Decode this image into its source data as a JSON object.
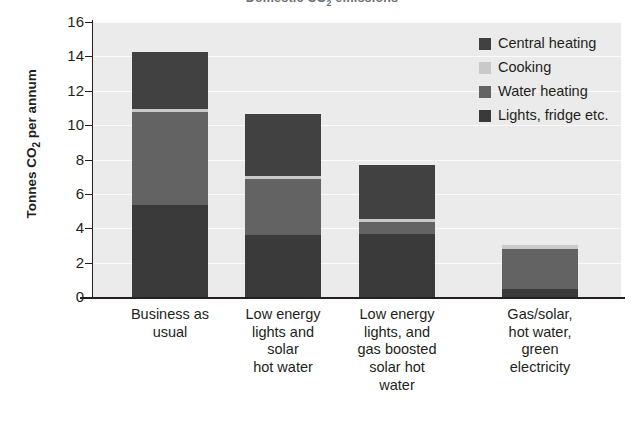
{
  "chart_data": {
    "type": "bar",
    "subtype": "stacked-bar",
    "title": "Domestic CO2 emissions",
    "title_html": "Domestic CO<sub>2</sub> emissions",
    "xlabel": "",
    "ylabel": "Tonnes CO2 per annum",
    "ylabel_html": "Tonnes CO<sub>2</sub> per annum",
    "ylim": [
      0,
      16
    ],
    "ytick_step": 2,
    "yticks": [
      0,
      2,
      4,
      6,
      8,
      10,
      12,
      14,
      16
    ],
    "grid": true,
    "grid_axis": "y",
    "legend_position": "top-right",
    "categories": [
      "Business as usual",
      "Low energy lights and solar hot water",
      "Low energy lights, and gas boosted solar hot water",
      "Gas/solar, hot water, green electricity"
    ],
    "category_lines": [
      [
        "Business as",
        "usual"
      ],
      [
        "Low energy",
        "lights and",
        "solar",
        "hot water"
      ],
      [
        "Low energy",
        "lights, and",
        "gas boosted",
        "solar hot",
        "water"
      ],
      [
        "Gas/solar,",
        "hot water,",
        "green",
        "electricity"
      ]
    ],
    "stack_order_bottom_to_top": [
      "Lights, fridge etc.",
      "Water heating",
      "Cooking",
      "Central heating"
    ],
    "series": [
      {
        "name": "Lights, fridge etc.",
        "color": "#3a3a3a",
        "values": [
          5.35,
          3.6,
          3.65,
          0.45
        ]
      },
      {
        "name": "Water heating",
        "color": "#636363",
        "values": [
          5.4,
          3.25,
          0.7,
          2.35
        ]
      },
      {
        "name": "Cooking",
        "color": "#c9c9c9",
        "values": [
          0.2,
          0.2,
          0.2,
          0.2
        ]
      },
      {
        "name": "Central heating",
        "color": "#414141",
        "values": [
          3.3,
          3.6,
          3.15,
          0.0
        ]
      }
    ],
    "totals": [
      14.25,
      10.65,
      7.7,
      3.0
    ],
    "colors": {
      "plot_background": "#ebebeb",
      "gridline": "#fafafa",
      "axis": "#231f20",
      "page_background": "#ffffff",
      "title_text": "#6d6e71"
    }
  },
  "legend": {
    "items": [
      {
        "label": "Central heating",
        "color": "#414141"
      },
      {
        "label": "Cooking",
        "color": "#c9c9c9"
      },
      {
        "label": "Water heating",
        "color": "#636363"
      },
      {
        "label": "Lights, fridge etc.",
        "color": "#3a3a3a"
      }
    ]
  }
}
